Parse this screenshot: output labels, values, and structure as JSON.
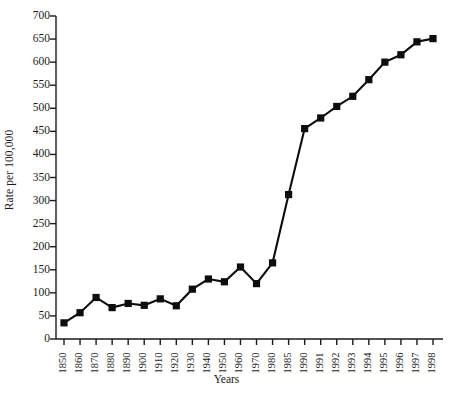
{
  "chart_data": {
    "type": "line",
    "title": "",
    "xlabel": "Years",
    "ylabel": "Rate per 100,000",
    "categories": [
      "1850",
      "1860",
      "1870",
      "1880",
      "1890",
      "1900",
      "1910",
      "1920",
      "1930",
      "1940",
      "1950",
      "1960",
      "1970",
      "1980",
      "1985",
      "1990",
      "1991",
      "1992",
      "1993",
      "1994",
      "1995",
      "1996",
      "1997",
      "1998"
    ],
    "values": [
      35,
      57,
      90,
      68,
      77,
      73,
      87,
      72,
      108,
      130,
      124,
      156,
      120,
      165,
      313,
      456,
      479,
      504,
      526,
      562,
      600,
      616,
      644,
      651
    ],
    "series": [
      {
        "name": "Rate per 100,000",
        "values": [
          35,
          57,
          90,
          68,
          77,
          73,
          87,
          72,
          108,
          130,
          124,
          156,
          120,
          165,
          313,
          456,
          479,
          504,
          526,
          562,
          600,
          616,
          644,
          651
        ]
      }
    ],
    "ylim": [
      0,
      700
    ],
    "ytick_step": 50,
    "yticks": [
      0,
      50,
      100,
      150,
      200,
      250,
      300,
      350,
      400,
      450,
      500,
      550,
      600,
      650,
      700
    ],
    "ytick_labels": [
      "0",
      "50",
      "100",
      "150",
      "200",
      "250",
      "300",
      "350",
      "400",
      "450",
      "500",
      "550",
      "600",
      "650",
      "700"
    ],
    "grid": false,
    "legend": false,
    "legend_position": "none",
    "marker": "square",
    "line_color": "#0d0d0d",
    "marker_color": "#0d0d0d",
    "axis_color": "#1a1a1a",
    "background_color": "#ffffff",
    "xtick_rotation": -90
  },
  "axes": {
    "y_title": "Rate per 100,000",
    "x_title": "Years"
  }
}
